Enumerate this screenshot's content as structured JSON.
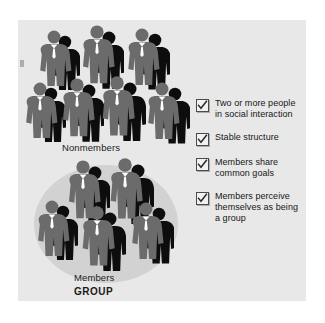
{
  "figure": {
    "panel_background": "#e8e8e8",
    "oval_color": "#d2d2d2",
    "person_color": "#6b6b6b",
    "shadow_color": "#0d0d0d",
    "labels": {
      "nonmembers": "Nonmembers",
      "members": "Members",
      "group": "GROUP"
    }
  },
  "criteria": {
    "items": [
      {
        "text": "Two or more people in social interaction",
        "checked": true
      },
      {
        "text": "Stable structure",
        "checked": true
      },
      {
        "text": "Members share common goals",
        "checked": true
      },
      {
        "text": "Members perceive themselves as being a group",
        "checked": true
      }
    ]
  },
  "people": {
    "nonmembers_count": 7,
    "members_count": 5
  }
}
